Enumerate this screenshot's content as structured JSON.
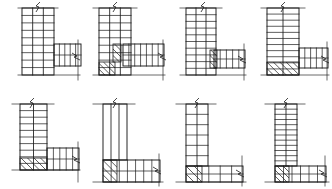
{
  "sheet": {
    "title": "RC Beam-Column Joint Reinforcement Details",
    "background_color": "#ffffff",
    "line_color": "#1a1a1a",
    "hatch_color": "#1a1a1a",
    "rows": 2,
    "columns": 4,
    "figure_count": 8
  },
  "legend": {
    "break_symbol_name": "zigzag-break-line",
    "hatch_symbol_name": "diagonal-hatch",
    "stirrup_name": "stirrup-tie-line"
  },
  "figures": [
    {
      "id": "fig-a",
      "label": "a",
      "position": {
        "x": 0,
        "y": 0
      },
      "type": "exterior-joint-column-above-and-below",
      "column": {
        "x": 22,
        "y": 8,
        "width": 32,
        "height": 67,
        "stirrup_count": 8,
        "vertical_bar_count": 2,
        "hatched": false
      },
      "beam": {
        "x": 54,
        "y": 44,
        "width": 27,
        "height": 22,
        "stirrup_count": 4,
        "longitudinal_bar_count": 1,
        "hatched": false
      },
      "breaks": [
        {
          "name": "column-top-break",
          "x": 38,
          "y": 8
        },
        {
          "name": "beam-right-break",
          "x": 76,
          "y": 55
        }
      ],
      "extension_lines": [
        {
          "name": "column-top-extension",
          "x1": 18,
          "y1": 8,
          "x2": 58,
          "y2": 8
        },
        {
          "name": "beam-right-extension",
          "x1": 78,
          "y1": 40,
          "x2": 78,
          "y2": 80
        },
        {
          "name": "base-extension",
          "x1": 18,
          "y1": 75,
          "x2": 80,
          "y2": 75
        }
      ],
      "hatch_zones": []
    },
    {
      "id": "fig-b",
      "label": "b",
      "position": {
        "x": 83,
        "y": 0
      },
      "type": "exterior-joint-with-haunch-hatch",
      "column": {
        "x": 16,
        "y": 8,
        "width": 32,
        "height": 67,
        "stirrup_count": 8,
        "vertical_bar_count": 2,
        "hatched": false
      },
      "beam": {
        "x": 40,
        "y": 44,
        "width": 41,
        "height": 22,
        "stirrup_count": 6,
        "longitudinal_bar_count": 1,
        "hatched": false
      },
      "breaks": [
        {
          "name": "column-top-break",
          "x": 32,
          "y": 8
        },
        {
          "name": "beam-right-break",
          "x": 79,
          "y": 55
        }
      ],
      "extension_lines": [
        {
          "name": "column-top-extension",
          "x1": 10,
          "y1": 8,
          "x2": 54,
          "y2": 8
        },
        {
          "name": "beam-right-extension",
          "x1": 80,
          "y1": 40,
          "x2": 80,
          "y2": 80
        },
        {
          "name": "base-extension",
          "x1": 10,
          "y1": 75,
          "x2": 82,
          "y2": 75
        }
      ],
      "hatch_zones": [
        {
          "name": "column-base-hatch",
          "x": 16,
          "y": 62,
          "width": 16,
          "height": 13,
          "line_count": 4
        },
        {
          "name": "mid-diagonal-hatch",
          "x": 30,
          "y": 44,
          "width": 8,
          "height": 18,
          "line_count": 3
        }
      ]
    },
    {
      "id": "fig-c",
      "label": "c",
      "position": {
        "x": 166,
        "y": 0
      },
      "type": "exterior-joint-offset-beam",
      "column": {
        "x": 20,
        "y": 8,
        "width": 30,
        "height": 67,
        "stirrup_count": 9,
        "vertical_bar_count": 2,
        "hatched": false
      },
      "beam": {
        "x": 48,
        "y": 50,
        "width": 31,
        "height": 18,
        "stirrup_count": 4,
        "longitudinal_bar_count": 1,
        "hatched": false
      },
      "breaks": [
        {
          "name": "column-top-break",
          "x": 37,
          "y": 8
        },
        {
          "name": "beam-right-break",
          "x": 76,
          "y": 58
        }
      ],
      "extension_lines": [
        {
          "name": "column-top-extension",
          "x1": 14,
          "y1": 8,
          "x2": 56,
          "y2": 8
        },
        {
          "name": "beam-right-extension",
          "x1": 78,
          "y1": 44,
          "x2": 78,
          "y2": 80
        },
        {
          "name": "base-extension",
          "x1": 14,
          "y1": 75,
          "x2": 80,
          "y2": 75
        }
      ],
      "hatch_zones": [
        {
          "name": "joint-diagonal-hatch",
          "x": 44,
          "y": 50,
          "width": 7,
          "height": 18,
          "line_count": 3
        }
      ]
    },
    {
      "id": "fig-d",
      "label": "d",
      "position": {
        "x": 249,
        "y": 0
      },
      "type": "exterior-joint-hatched-column-base",
      "column": {
        "x": 18,
        "y": 8,
        "width": 32,
        "height": 67,
        "stirrup_count": 10,
        "vertical_bar_count": 1,
        "hatched": false
      },
      "beam": {
        "x": 50,
        "y": 48,
        "width": 29,
        "height": 20,
        "stirrup_count": 4,
        "longitudinal_bar_count": 1,
        "hatched": false
      },
      "breaks": [
        {
          "name": "column-top-break",
          "x": 34,
          "y": 8
        },
        {
          "name": "beam-right-break",
          "x": 76,
          "y": 58
        }
      ],
      "extension_lines": [
        {
          "name": "column-top-extension",
          "x1": 12,
          "y1": 8,
          "x2": 56,
          "y2": 8
        },
        {
          "name": "beam-right-extension",
          "x1": 78,
          "y1": 42,
          "x2": 78,
          "y2": 80
        },
        {
          "name": "base-extension",
          "x1": 12,
          "y1": 75,
          "x2": 80,
          "y2": 75
        }
      ],
      "hatch_zones": [
        {
          "name": "column-base-hatch",
          "x": 18,
          "y": 62,
          "width": 32,
          "height": 13,
          "line_count": 6
        }
      ]
    },
    {
      "id": "fig-e",
      "label": "e",
      "position": {
        "x": 0,
        "y": 94
      },
      "type": "corner-joint-hatched-base",
      "column": {
        "x": 20,
        "y": 10,
        "width": 27,
        "height": 66,
        "stirrup_count": 9,
        "vertical_bar_count": 1,
        "hatched": false
      },
      "beam": {
        "x": 47,
        "y": 54,
        "width": 32,
        "height": 22,
        "stirrup_count": 4,
        "longitudinal_bar_count": 1,
        "hatched": false
      },
      "breaks": [
        {
          "name": "column-top-break",
          "x": 32,
          "y": 10
        },
        {
          "name": "beam-right-break",
          "x": 76,
          "y": 64
        }
      ],
      "extension_lines": [
        {
          "name": "column-top-extension",
          "x1": 12,
          "y1": 10,
          "x2": 54,
          "y2": 10
        },
        {
          "name": "beam-right-extension",
          "x1": 78,
          "y1": 48,
          "x2": 78,
          "y2": 88
        },
        {
          "name": "base-extension",
          "x1": 12,
          "y1": 76,
          "x2": 80,
          "y2": 76
        }
      ],
      "hatch_zones": [
        {
          "name": "column-base-hatch",
          "x": 20,
          "y": 64,
          "width": 27,
          "height": 12,
          "line_count": 5
        }
      ]
    },
    {
      "id": "fig-f",
      "label": "f",
      "position": {
        "x": 83,
        "y": 94
      },
      "type": "corner-joint-plain-column",
      "column": {
        "x": 20,
        "y": 10,
        "width": 24,
        "height": 56,
        "stirrup_count": 0,
        "vertical_bar_count": 2,
        "hatched": false
      },
      "beam": {
        "x": 20,
        "y": 66,
        "width": 57,
        "height": 22,
        "stirrup_count": 6,
        "longitudinal_bar_count": 1,
        "hatched": false
      },
      "breaks": [
        {
          "name": "column-top-break",
          "x": 32,
          "y": 10
        },
        {
          "name": "beam-right-break",
          "x": 74,
          "y": 75
        }
      ],
      "extension_lines": [
        {
          "name": "column-top-extension",
          "x1": 10,
          "y1": 10,
          "x2": 52,
          "y2": 10
        },
        {
          "name": "beam-right-extension",
          "x1": 76,
          "y1": 60,
          "x2": 76,
          "y2": 92
        },
        {
          "name": "base-extension",
          "x1": 10,
          "y1": 88,
          "x2": 80,
          "y2": 88
        }
      ],
      "hatch_zones": [
        {
          "name": "joint-corner-hatch",
          "x": 20,
          "y": 66,
          "width": 14,
          "height": 22,
          "line_count": 4
        }
      ]
    },
    {
      "id": "fig-g",
      "label": "g",
      "position": {
        "x": 166,
        "y": 94
      },
      "type": "corner-joint-diagonal-brace",
      "column": {
        "x": 20,
        "y": 10,
        "width": 22,
        "height": 62,
        "stirrup_count": 5,
        "vertical_bar_count": 1,
        "hatched": false
      },
      "beam": {
        "x": 20,
        "y": 72,
        "width": 57,
        "height": 16,
        "stirrup_count": 4,
        "longitudinal_bar_count": 1,
        "hatched": false
      },
      "breaks": [
        {
          "name": "column-top-break",
          "x": 31,
          "y": 10
        },
        {
          "name": "beam-right-break",
          "x": 74,
          "y": 78
        }
      ],
      "extension_lines": [
        {
          "name": "column-top-extension",
          "x1": 10,
          "y1": 10,
          "x2": 50,
          "y2": 10
        },
        {
          "name": "beam-right-extension",
          "x1": 76,
          "y1": 62,
          "x2": 76,
          "y2": 92
        },
        {
          "name": "base-extension",
          "x1": 10,
          "y1": 88,
          "x2": 80,
          "y2": 88
        }
      ],
      "hatch_zones": [
        {
          "name": "corner-diagonal-brace",
          "x": 20,
          "y": 72,
          "width": 16,
          "height": 16,
          "line_count": 3
        }
      ]
    },
    {
      "id": "fig-h",
      "label": "h",
      "position": {
        "x": 249,
        "y": 94
      },
      "type": "corner-joint-hatched-knee",
      "column": {
        "x": 26,
        "y": 10,
        "width": 22,
        "height": 62,
        "stirrup_count": 11,
        "vertical_bar_count": 1,
        "hatched": false
      },
      "beam": {
        "x": 26,
        "y": 72,
        "width": 51,
        "height": 16,
        "stirrup_count": 5,
        "longitudinal_bar_count": 1,
        "hatched": false
      },
      "breaks": [
        {
          "name": "column-top-break",
          "x": 37,
          "y": 10
        },
        {
          "name": "beam-right-break",
          "x": 74,
          "y": 78
        }
      ],
      "extension_lines": [
        {
          "name": "column-top-extension",
          "x1": 16,
          "y1": 10,
          "x2": 56,
          "y2": 10
        },
        {
          "name": "beam-right-extension",
          "x1": 76,
          "y1": 62,
          "x2": 76,
          "y2": 92
        },
        {
          "name": "base-extension",
          "x1": 16,
          "y1": 88,
          "x2": 80,
          "y2": 88
        }
      ],
      "hatch_zones": [
        {
          "name": "knee-hatch",
          "x": 26,
          "y": 72,
          "width": 14,
          "height": 16,
          "line_count": 4
        }
      ]
    }
  ]
}
